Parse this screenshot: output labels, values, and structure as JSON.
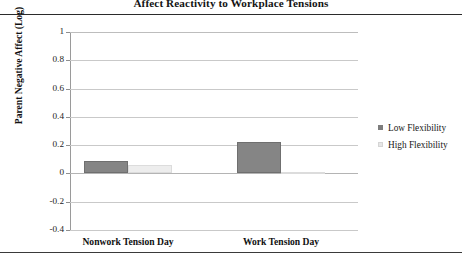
{
  "figure": {
    "title": "Affect Reactivity to Workplace Tensions"
  },
  "chart_data": {
    "type": "bar",
    "title": "Affect Reactivity to Workplace Tensions",
    "xlabel": "",
    "ylabel": "Parent Negative Affect (Log)",
    "categories": [
      "Nonwork Tension Day",
      "Work Tension Day"
    ],
    "series": [
      {
        "name": "Low Flexibility",
        "color": "#858585",
        "values": [
          0.085,
          0.22
        ]
      },
      {
        "name": "High Flexibility",
        "color": "#ededed",
        "values": [
          0.06,
          0.01
        ]
      }
    ],
    "ylim": [
      -0.4,
      1
    ],
    "yticks": [
      1,
      0.8,
      0.6,
      0.4,
      0.2,
      0,
      -0.2,
      -0.4
    ],
    "ytick_labels": [
      "1",
      "0.8",
      "0.6",
      "0.4",
      "0.2",
      "0",
      "-0.2",
      "-0.4"
    ],
    "grid": true,
    "legend_position": "right"
  },
  "legend": {
    "items": [
      {
        "label": "Low Flexibility",
        "swatch": "low-flexibility-swatch"
      },
      {
        "label": "High Flexibility",
        "swatch": "high-flexibility-swatch"
      }
    ]
  }
}
